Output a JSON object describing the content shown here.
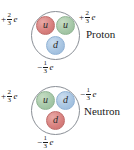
{
  "figure": {
    "colors": {
      "quark_red": "#d8807e",
      "quark_green": "#a6c8a8",
      "quark_blue": "#a8c5e2",
      "shell_outline": "#8a8f96",
      "text": "#1a1a1a",
      "background": "#ffffff"
    },
    "nucleons": [
      {
        "id": "proton",
        "name": "Proton",
        "quarks": [
          {
            "position": "top-left",
            "label": "u",
            "color": "red"
          },
          {
            "position": "top-right",
            "label": "u",
            "color": "green"
          },
          {
            "position": "bottom",
            "label": "d",
            "color": "blue"
          }
        ],
        "charges": {
          "left": {
            "sign": "+",
            "numerator": "2",
            "denominator": "3",
            "unit": "e"
          },
          "right": {
            "sign": "+",
            "numerator": "2",
            "denominator": "3",
            "unit": "e"
          },
          "bottom": {
            "sign": "−",
            "numerator": "1",
            "denominator": "3",
            "unit": "e"
          }
        }
      },
      {
        "id": "neutron",
        "name": "Neutron",
        "quarks": [
          {
            "position": "top-left",
            "label": "u",
            "color": "green"
          },
          {
            "position": "top-right",
            "label": "d",
            "color": "blue"
          },
          {
            "position": "bottom",
            "label": "d",
            "color": "red"
          }
        ],
        "charges": {
          "left": {
            "sign": "+",
            "numerator": "2",
            "denominator": "3",
            "unit": "e"
          },
          "right": {
            "sign": "−",
            "numerator": "1",
            "denominator": "3",
            "unit": "e"
          },
          "bottom": {
            "sign": "−",
            "numerator": "1",
            "denominator": "3",
            "unit": "e"
          }
        }
      }
    ]
  }
}
